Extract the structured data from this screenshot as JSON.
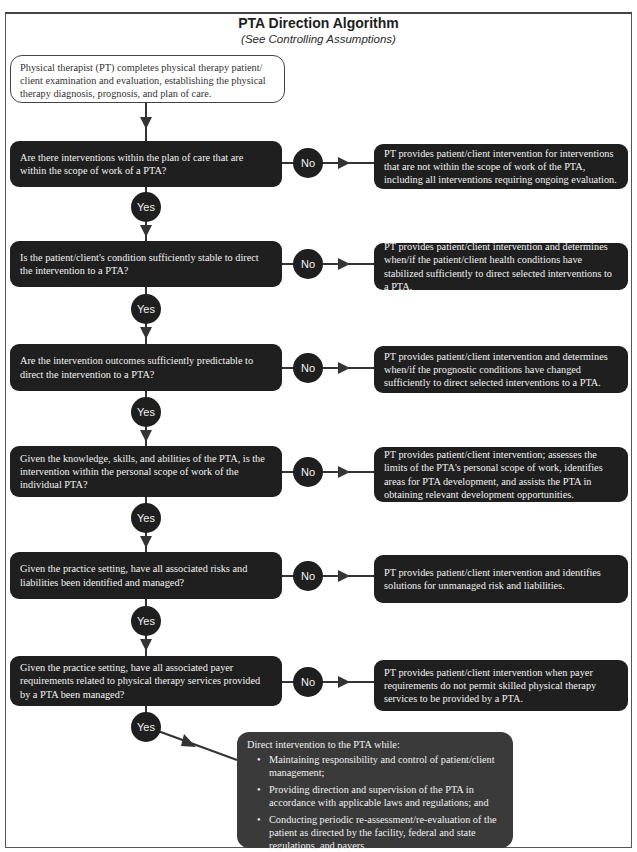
{
  "header": {
    "title": "PTA Direction Algorithm",
    "subtitle": "(See Controlling Assumptions)"
  },
  "start": {
    "text": "Physical therapist (PT) completes physical therapy patient/ client examination and evaluation, establishing the physical therapy diagnosis, prognosis, and plan of care."
  },
  "labels": {
    "yes": "Yes",
    "no": "No"
  },
  "steps": [
    {
      "question": "Are there interventions within the plan of care that are within the scope of work of a PTA?",
      "no_action": "PT provides patient/client intervention for interventions that are not within the scope of work of the PTA, including all interventions requiring ongoing evaluation."
    },
    {
      "question": "Is the patient/client's condition sufficiently stable to direct the intervention to a PTA?",
      "no_action": "PT provides patient/client intervention and determines when/if the patient/client health conditions have stabilized sufficiently to direct selected interventions to a PTA."
    },
    {
      "question": "Are the intervention outcomes sufficiently predictable to direct the intervention to a PTA?",
      "no_action": "PT provides patient/client intervention and determines when/if the prognostic conditions have changed sufficiently to direct selected interventions to a PTA."
    },
    {
      "question": "Given the knowledge, skills, and abilities of the PTA, is the intervention within the personal scope of work of the individual PTA?",
      "no_action": "PT provides patient/client intervention; assesses the limits of the PTA's personal scope of work, identifies areas for PTA development, and assists the PTA in obtaining relevant development opportunities."
    },
    {
      "question": "Given the practice setting, have all associated risks and liabilities been identified and managed?",
      "no_action": "PT provides patient/client intervention and identifies solutions for unmanaged risk and liabilities."
    },
    {
      "question": "Given the practice setting, have all associated payer requirements related to physical therapy services provided by a PTA been managed?",
      "no_action": "PT provides patient/client intervention when payer requirements do not permit skilled physical therapy services to be provided by a PTA."
    }
  ],
  "final": {
    "intro": "Direct intervention to the PTA while:",
    "bullets": [
      "Maintaining responsibility and control of patient/client management;",
      "Providing direction and supervision of the PTA in accordance with applicable laws and regulations; and",
      "Conducting periodic re-assessment/re-evaluation of the patient as directed by the facility, federal and state regulations, and payers."
    ]
  },
  "colors": {
    "box_dark": "#1f1f1f",
    "final_box": "#3a3a3a",
    "line": "#333333"
  }
}
